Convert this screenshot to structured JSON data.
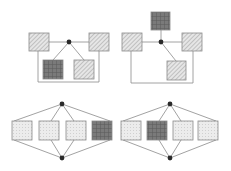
{
  "figure": {
    "width": 231,
    "height": 171,
    "background": "#ffffff",
    "line_color": "#8a8a8a",
    "node_color": "#2a2a2a",
    "box_stroke": "#8a8a8a"
  },
  "fills": {
    "hatched": {
      "bg": "#e6e6e6",
      "stroke": "#9a9a9a"
    },
    "dark_grid": {
      "bg": "#7a7a7a",
      "stroke": "#5a5a5a"
    },
    "light_dotted": {
      "bg": "#ececec",
      "stroke": "#d0d0d0"
    }
  },
  "diagrams": [
    {
      "id": "top-left",
      "hubs": [
        {
          "x": 69,
          "y": 42
        }
      ],
      "boxes": [
        {
          "id": "left",
          "x": 29,
          "y": 33,
          "w": 20,
          "h": 18,
          "fill": "hatched"
        },
        {
          "id": "right",
          "x": 89,
          "y": 33,
          "w": 20,
          "h": 18,
          "fill": "hatched"
        },
        {
          "id": "bottom-left",
          "x": 43,
          "y": 60,
          "w": 20,
          "h": 19,
          "fill": "dark_grid"
        },
        {
          "id": "bottom-right",
          "x": 74,
          "y": 60,
          "w": 20,
          "h": 19,
          "fill": "hatched"
        }
      ],
      "lines": [
        [
          49,
          42,
          69,
          42
        ],
        [
          69,
          42,
          89,
          42
        ],
        [
          69,
          42,
          53,
          60
        ],
        [
          69,
          42,
          84,
          60
        ],
        [
          38,
          51,
          38,
          82
        ],
        [
          38,
          82,
          99,
          82
        ],
        [
          99,
          82,
          99,
          51
        ]
      ]
    },
    {
      "id": "top-right",
      "hubs": [
        {
          "x": 161,
          "y": 42
        }
      ],
      "boxes": [
        {
          "id": "top",
          "x": 151,
          "y": 12,
          "w": 19,
          "h": 18,
          "fill": "dark_grid"
        },
        {
          "id": "left",
          "x": 122,
          "y": 33,
          "w": 20,
          "h": 18,
          "fill": "hatched"
        },
        {
          "id": "right",
          "x": 182,
          "y": 33,
          "w": 20,
          "h": 18,
          "fill": "hatched"
        },
        {
          "id": "bottom",
          "x": 167,
          "y": 61,
          "w": 19,
          "h": 19,
          "fill": "hatched"
        }
      ],
      "lines": [
        [
          142,
          42,
          161,
          42
        ],
        [
          161,
          42,
          182,
          42
        ],
        [
          161,
          30,
          161,
          42
        ],
        [
          161,
          42,
          176,
          61
        ],
        [
          131,
          51,
          131,
          83
        ],
        [
          131,
          83,
          193,
          83
        ],
        [
          193,
          83,
          193,
          51
        ]
      ]
    },
    {
      "id": "bottom-left",
      "hubs": [
        {
          "x": 62,
          "y": 104
        },
        {
          "x": 62,
          "y": 158
        }
      ],
      "boxes": [
        {
          "id": "b1",
          "x": 12,
          "y": 121,
          "w": 20,
          "h": 19,
          "fill": "light_dotted"
        },
        {
          "id": "b2",
          "x": 39,
          "y": 121,
          "w": 20,
          "h": 19,
          "fill": "light_dotted"
        },
        {
          "id": "b3",
          "x": 66,
          "y": 121,
          "w": 20,
          "h": 19,
          "fill": "light_dotted"
        },
        {
          "id": "b4",
          "x": 92,
          "y": 121,
          "w": 20,
          "h": 19,
          "fill": "dark_grid"
        }
      ],
      "lines": [
        [
          62,
          104,
          14,
          121
        ],
        [
          62,
          104,
          51,
          121
        ],
        [
          62,
          104,
          74,
          121
        ],
        [
          62,
          104,
          110,
          121
        ],
        [
          62,
          158,
          14,
          140
        ],
        [
          62,
          158,
          51,
          140
        ],
        [
          62,
          158,
          74,
          140
        ],
        [
          62,
          158,
          110,
          140
        ]
      ]
    },
    {
      "id": "bottom-right",
      "hubs": [
        {
          "x": 170,
          "y": 104
        },
        {
          "x": 170,
          "y": 158
        }
      ],
      "boxes": [
        {
          "id": "b1",
          "x": 121,
          "y": 121,
          "w": 20,
          "h": 19,
          "fill": "light_dotted"
        },
        {
          "id": "b2",
          "x": 147,
          "y": 121,
          "w": 20,
          "h": 19,
          "fill": "dark_grid"
        },
        {
          "id": "b3",
          "x": 173,
          "y": 121,
          "w": 20,
          "h": 19,
          "fill": "light_dotted"
        },
        {
          "id": "b4",
          "x": 198,
          "y": 121,
          "w": 20,
          "h": 19,
          "fill": "light_dotted"
        }
      ],
      "lines": [
        [
          170,
          104,
          123,
          121
        ],
        [
          170,
          104,
          159,
          121
        ],
        [
          170,
          104,
          181,
          121
        ],
        [
          170,
          104,
          216,
          121
        ],
        [
          170,
          158,
          123,
          140
        ],
        [
          170,
          158,
          159,
          140
        ],
        [
          170,
          158,
          181,
          140
        ],
        [
          170,
          158,
          216,
          140
        ]
      ]
    }
  ]
}
